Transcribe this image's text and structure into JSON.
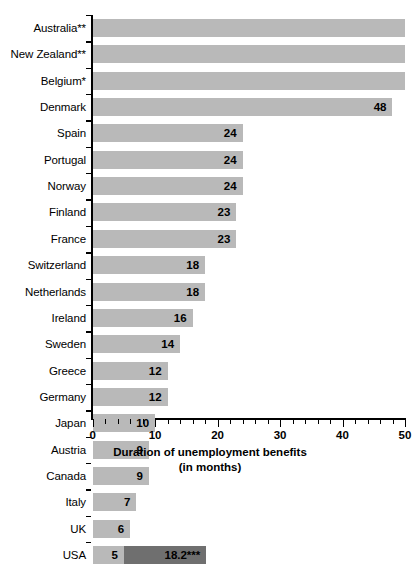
{
  "chart_data": {
    "type": "bar",
    "orientation": "horizontal",
    "title": "",
    "xlabel": "Duration of unemployment benefits",
    "xlabel_line2": "(in months)",
    "ylabel": "",
    "xlim": [
      0,
      50
    ],
    "xticks": [
      0,
      10,
      20,
      30,
      40,
      50
    ],
    "xtick_labels": [
      "0",
      "10",
      "20",
      "30",
      "40",
      "50"
    ],
    "minor_tick_step": 2,
    "grid": false,
    "legend": null,
    "categories": [
      "Australia**",
      "New Zealand**",
      "Belgium*",
      "Denmark",
      "Spain",
      "Portugal",
      "Norway",
      "Finland",
      "France",
      "Switzerland",
      "Netherlands",
      "Ireland",
      "Sweden",
      "Greece",
      "Germany",
      "Japan",
      "Austria",
      "Canada",
      "Italy",
      "UK",
      "USA"
    ],
    "values": [
      50,
      50,
      50,
      48,
      24,
      24,
      24,
      23,
      23,
      18,
      18,
      16,
      14,
      12,
      12,
      10,
      9,
      9,
      7,
      6,
      5
    ],
    "data_labels": [
      "",
      "",
      "",
      "48",
      "24",
      "24",
      "24",
      "23",
      "23",
      "18",
      "18",
      "16",
      "14",
      "12",
      "12",
      "10",
      "9",
      "9",
      "7",
      "6",
      "5"
    ],
    "extension_segment": {
      "category": "USA",
      "from": 5,
      "to": 18.2,
      "label": "18.2***"
    },
    "colors": {
      "bar_primary": "#b9b9b9",
      "bar_extension": "#6f6f6f",
      "axis": "#000000",
      "text": "#000000",
      "background": "#ffffff"
    }
  },
  "footnotes": {
    "one_star": "*",
    "two_star": "**",
    "three_star": "***"
  }
}
